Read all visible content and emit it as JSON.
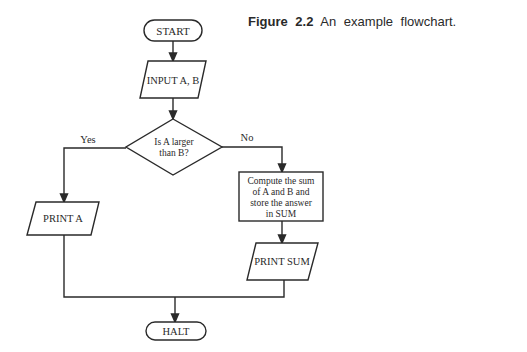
{
  "caption": {
    "label": "Figure",
    "number": "2.2",
    "text": "An example flowchart."
  },
  "flowchart": {
    "start": "START",
    "input": "INPUT A, B",
    "decision": {
      "line1": "Is A larger",
      "line2": "than B?"
    },
    "yes_label": "Yes",
    "no_label": "No",
    "process": {
      "line1": "Compute the sum",
      "line2": "of A and B and",
      "line3": "store the answer",
      "line4": "in SUM"
    },
    "print_a": "PRINT A",
    "print_sum": "PRINT SUM",
    "halt": "HALT"
  },
  "colors": {
    "stroke": "#2a2a2a",
    "background": "#ffffff"
  }
}
